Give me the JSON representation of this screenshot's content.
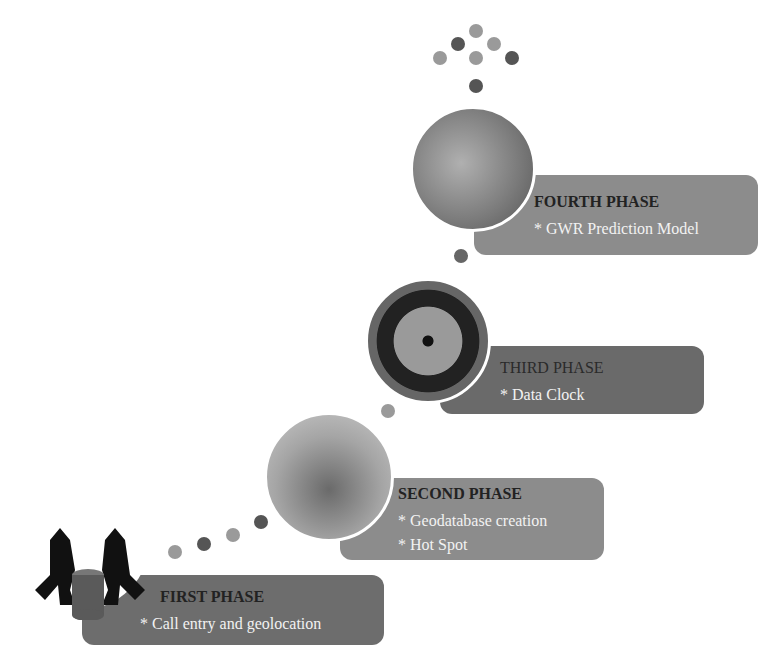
{
  "phases": [
    {
      "title": "FIRST PHASE",
      "items": [
        "* Call entry and geolocation"
      ]
    },
    {
      "title": "SECOND PHASE",
      "items": [
        "* Geodatabase creation",
        "* Hot Spot"
      ]
    },
    {
      "title": "THIRD PHASE",
      "items": [
        "* Data Clock"
      ]
    },
    {
      "title": "FOURTH PHASE",
      "items": [
        "* GWR Prediction Model"
      ]
    }
  ],
  "colors": {
    "panel_dark": "#6a6a6a",
    "panel_light": "#8c8c8c",
    "dot_dark": "#5a5a5a",
    "dot_light": "#9a9a9a"
  }
}
